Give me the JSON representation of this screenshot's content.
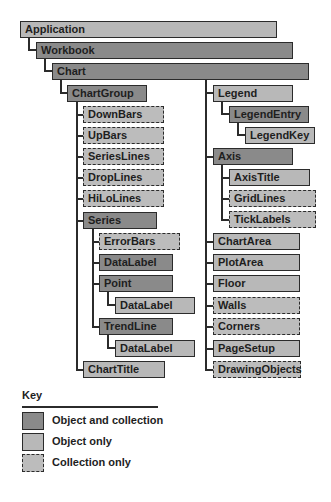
{
  "colors": {
    "object_and_collection": "#8a8a8a",
    "object_only": "#b8b8b8",
    "collection_only": "#bcbcbc",
    "outline": "#2b2b2b"
  },
  "nodes": [
    {
      "id": "application",
      "label": "Application",
      "kind": "obj",
      "x": 20,
      "y": 21,
      "w": 257
    },
    {
      "id": "workbook",
      "label": "Workbook",
      "kind": "both",
      "x": 36,
      "y": 42,
      "w": 257
    },
    {
      "id": "chart",
      "label": "Chart",
      "kind": "both",
      "x": 52,
      "y": 63,
      "w": 257
    },
    {
      "id": "chartgroup",
      "label": "ChartGroup",
      "kind": "both",
      "x": 67,
      "y": 85,
      "w": 80
    },
    {
      "id": "downbars",
      "label": "DownBars",
      "kind": "coll",
      "x": 83,
      "y": 106,
      "w": 81
    },
    {
      "id": "upbars",
      "label": "UpBars",
      "kind": "coll",
      "x": 83,
      "y": 127,
      "w": 81
    },
    {
      "id": "serieslines",
      "label": "SeriesLines",
      "kind": "coll",
      "x": 83,
      "y": 148,
      "w": 81
    },
    {
      "id": "droplines",
      "label": "DropLines",
      "kind": "coll",
      "x": 83,
      "y": 169,
      "w": 81
    },
    {
      "id": "hilolines",
      "label": "HiLoLines",
      "kind": "coll",
      "x": 83,
      "y": 190,
      "w": 81
    },
    {
      "id": "series",
      "label": "Series",
      "kind": "both",
      "x": 83,
      "y": 212,
      "w": 74
    },
    {
      "id": "errorbars",
      "label": "ErrorBars",
      "kind": "coll",
      "x": 99,
      "y": 233,
      "w": 81
    },
    {
      "id": "series-datalabel",
      "label": "DataLabel",
      "kind": "both",
      "x": 99,
      "y": 254,
      "w": 74
    },
    {
      "id": "point",
      "label": "Point",
      "kind": "both",
      "x": 99,
      "y": 275,
      "w": 74
    },
    {
      "id": "point-datalabel",
      "label": "DataLabel",
      "kind": "obj",
      "x": 115,
      "y": 297,
      "w": 80
    },
    {
      "id": "trendline",
      "label": "TrendLine",
      "kind": "both",
      "x": 99,
      "y": 318,
      "w": 74
    },
    {
      "id": "trendline-datalabel",
      "label": "DataLabel",
      "kind": "obj",
      "x": 115,
      "y": 340,
      "w": 80
    },
    {
      "id": "charttitle",
      "label": "ChartTitle",
      "kind": "obj",
      "x": 83,
      "y": 361,
      "w": 82
    },
    {
      "id": "legend",
      "label": "Legend",
      "kind": "obj",
      "x": 213,
      "y": 85,
      "w": 80
    },
    {
      "id": "legendentry",
      "label": "LegendEntry",
      "kind": "both",
      "x": 229,
      "y": 106,
      "w": 80
    },
    {
      "id": "legendkey",
      "label": "LegendKey",
      "kind": "obj",
      "x": 245,
      "y": 127,
      "w": 70
    },
    {
      "id": "axis",
      "label": "Axis",
      "kind": "both",
      "x": 213,
      "y": 148,
      "w": 80
    },
    {
      "id": "axistitle",
      "label": "AxisTitle",
      "kind": "obj",
      "x": 229,
      "y": 169,
      "w": 81
    },
    {
      "id": "gridlines",
      "label": "GridLines",
      "kind": "coll",
      "x": 229,
      "y": 190,
      "w": 87
    },
    {
      "id": "ticklabels",
      "label": "TickLabels",
      "kind": "coll",
      "x": 229,
      "y": 211,
      "w": 87
    },
    {
      "id": "chartarea",
      "label": "ChartArea",
      "kind": "obj",
      "x": 213,
      "y": 233,
      "w": 87
    },
    {
      "id": "plotarea",
      "label": "PlotArea",
      "kind": "obj",
      "x": 213,
      "y": 254,
      "w": 87
    },
    {
      "id": "floor",
      "label": "Floor",
      "kind": "obj",
      "x": 213,
      "y": 275,
      "w": 87
    },
    {
      "id": "walls",
      "label": "Walls",
      "kind": "coll",
      "x": 213,
      "y": 297,
      "w": 87
    },
    {
      "id": "corners",
      "label": "Corners",
      "kind": "coll",
      "x": 213,
      "y": 318,
      "w": 87
    },
    {
      "id": "pagesetup",
      "label": "PageSetup",
      "kind": "obj",
      "x": 213,
      "y": 340,
      "w": 87
    },
    {
      "id": "drawingobjects",
      "label": "DrawingObjects",
      "kind": "coll",
      "x": 213,
      "y": 361,
      "w": 88
    }
  ],
  "key": {
    "title": "Key",
    "items": [
      {
        "kind": "both",
        "label": "Object and collection"
      },
      {
        "kind": "obj",
        "label": "Object only"
      },
      {
        "kind": "coll",
        "label": "Collection only"
      }
    ]
  }
}
